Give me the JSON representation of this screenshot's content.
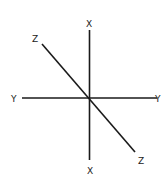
{
  "diagram": {
    "type": "3d-axes",
    "line_color": "#1a1a1a",
    "label_color": "#222222",
    "axes": [
      {
        "name": "X",
        "label_start": "X",
        "label_end": "X",
        "x1": 89.5,
        "y1": 30,
        "x2": 89.5,
        "y2": 160
      },
      {
        "name": "Y",
        "label_start": "Y",
        "label_end": "Y",
        "x1": 22,
        "y1": 98,
        "x2": 157,
        "y2": 98
      },
      {
        "name": "Z",
        "label_start": "Z",
        "label_end": "Z",
        "x1": 42,
        "y1": 44,
        "x2": 135,
        "y2": 152
      }
    ],
    "labels": {
      "x_top": "X",
      "x_bottom": "X",
      "y_left": "Y",
      "y_right": "Y",
      "z_top": "Z",
      "z_bottom": "Z"
    },
    "origin": {
      "x": 89.5,
      "y": 98
    }
  }
}
